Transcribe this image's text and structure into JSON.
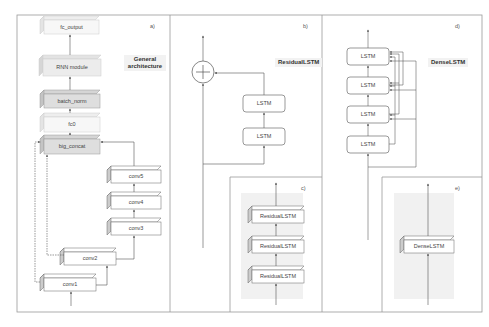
{
  "figure": {
    "panels": [
      {
        "id": "a",
        "tag": "a)",
        "title_line1": "General",
        "title_line2": "architecture",
        "blocks": [
          "fc_output",
          "RNN module",
          "batch_norm",
          "fc0",
          "big_concat",
          "conv5",
          "conv4",
          "conv3",
          "conv2",
          "conv1"
        ]
      },
      {
        "id": "b",
        "tag": "b)",
        "title": "ResidualLSTM",
        "blocks": [
          "LSTM",
          "LSTM"
        ],
        "operator": "+"
      },
      {
        "id": "c",
        "tag": "c)",
        "blocks": [
          "ResidualLSTM",
          "ResidualLSTM",
          "ResidualLSTM"
        ]
      },
      {
        "id": "d",
        "tag": "d)",
        "title": "DenseLSTM",
        "blocks": [
          "LSTM",
          "LSTM",
          "LSTM",
          "LSTM"
        ]
      },
      {
        "id": "e",
        "tag": "e)",
        "blocks": [
          "DenseLSTM"
        ]
      }
    ]
  },
  "colors": {
    "frame": "#999999",
    "box_dark": "#d9d9d9",
    "box_light": "#f4f4f4",
    "line": "#555555"
  }
}
